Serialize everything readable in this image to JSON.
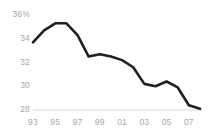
{
  "chart_data": {
    "type": "line",
    "title": "",
    "subtitle": "",
    "xlabel": "",
    "ylabel": "",
    "grid": false,
    "legend_position": "none",
    "line_color": "#231f20",
    "axis_label_color": "#a7a7a7",
    "baseline_color": "#d9d9d9",
    "ylim": [
      28,
      36
    ],
    "xlim": [
      1993,
      2008
    ],
    "y_ticks": [
      36,
      34,
      32,
      30,
      28
    ],
    "y_tick_labels": [
      "36%",
      "34",
      "32",
      "30",
      "28"
    ],
    "x_ticks": [
      1993,
      1995,
      1997,
      1999,
      2001,
      2003,
      2005,
      2007
    ],
    "x_tick_labels": [
      "93",
      "95",
      "97",
      "99",
      "01",
      "03",
      "05",
      "07"
    ],
    "x": [
      1993,
      1994,
      1995,
      1996,
      1997,
      1998,
      1999,
      2000,
      2001,
      2002,
      2003,
      2004,
      2005,
      2006,
      2007,
      2008
    ],
    "values": [
      33.7,
      34.7,
      35.3,
      35.3,
      34.3,
      32.5,
      32.7,
      32.5,
      32.2,
      31.6,
      30.2,
      30.0,
      30.4,
      29.9,
      28.4,
      28.1
    ],
    "series": [
      {
        "name": "",
        "values": [
          33.7,
          34.7,
          35.3,
          35.3,
          34.3,
          32.5,
          32.7,
          32.5,
          32.2,
          31.6,
          30.2,
          30.0,
          30.4,
          29.9,
          28.4,
          28.1
        ]
      }
    ]
  },
  "geometry": {
    "plot_left": 33,
    "plot_right": 200,
    "y_top_px": 15,
    "y_bottom_px": 110
  }
}
